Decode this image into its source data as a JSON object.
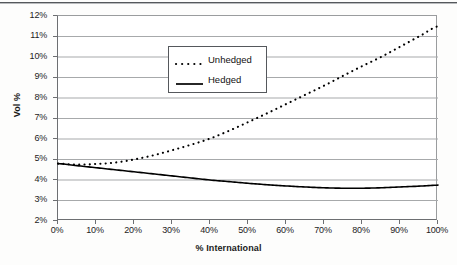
{
  "chart_data": {
    "type": "line",
    "title": "",
    "xlabel": "% International",
    "ylabel": "Vol %",
    "xlim": [
      0,
      100
    ],
    "ylim": [
      2,
      12
    ],
    "grid": true,
    "legend_position": "upper-left-inside",
    "x_tick_labels": [
      "0%",
      "10%",
      "20%",
      "30%",
      "40%",
      "50%",
      "60%",
      "70%",
      "80%",
      "90%",
      "100%"
    ],
    "y_tick_labels": [
      "2%",
      "3%",
      "4%",
      "5%",
      "6%",
      "7%",
      "8%",
      "9%",
      "10%",
      "11%",
      "12%"
    ],
    "x": [
      0,
      5,
      10,
      15,
      20,
      25,
      30,
      35,
      40,
      45,
      50,
      55,
      60,
      65,
      70,
      75,
      80,
      85,
      90,
      95,
      100
    ],
    "series": [
      {
        "name": "Unhedged",
        "style": "dotted",
        "color": "#000000",
        "values": [
          4.8,
          4.75,
          4.78,
          4.85,
          5.0,
          5.2,
          5.45,
          5.72,
          6.02,
          6.4,
          6.82,
          7.25,
          7.7,
          8.15,
          8.6,
          9.08,
          9.55,
          10.0,
          10.5,
          11.0,
          11.5
        ]
      },
      {
        "name": "Hedged",
        "style": "solid",
        "color": "#000000",
        "values": [
          4.8,
          4.7,
          4.6,
          4.5,
          4.4,
          4.3,
          4.2,
          4.1,
          4.0,
          3.92,
          3.84,
          3.77,
          3.71,
          3.66,
          3.62,
          3.6,
          3.6,
          3.62,
          3.66,
          3.7,
          3.75
        ]
      }
    ]
  },
  "legend": {
    "items": [
      {
        "label": "Unhedged",
        "style": "dotted"
      },
      {
        "label": "Hedged",
        "style": "solid"
      }
    ]
  },
  "axes": {
    "y_title": "Vol %",
    "x_title": "% International"
  }
}
